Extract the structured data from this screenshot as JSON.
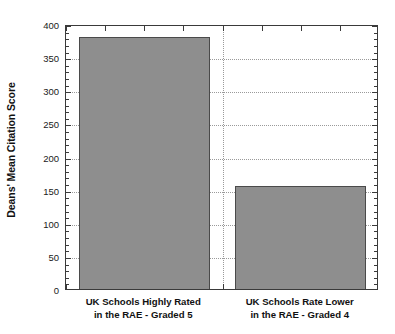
{
  "chart_data": {
    "type": "bar",
    "title": "",
    "subtitle": "",
    "xlabel": "",
    "ylabel": "Deans' Mean Citation Score",
    "categories": [
      "UK Schools Highly Rated\nin the RAE - Graded 5",
      "UK Schools Rate Lower\nin the RAE - Graded 4"
    ],
    "category_lines": [
      [
        "UK Schools Highly Rated",
        "in the RAE - Graded 5"
      ],
      [
        "UK Schools Rate Lower",
        "in the RAE - Graded 4"
      ]
    ],
    "values": [
      381,
      155
    ],
    "ylim": [
      0,
      400
    ],
    "ytick_values": [
      0,
      50,
      100,
      150,
      200,
      250,
      300,
      350,
      400
    ],
    "ytick_labels": [
      "0",
      "50",
      "100",
      "150",
      "200",
      "250",
      "300",
      "350",
      "400"
    ],
    "minor_tick_step": 10,
    "grid": {
      "horizontal": true,
      "vertical": true,
      "style": "dotted",
      "color": "#9a9a9a"
    },
    "legend": null,
    "colors": {
      "bar_fill": "#8e8e8e",
      "bar_edge": "#4a4a4a",
      "axis": "#3a3a3a",
      "grid": "#9a9a9a",
      "text": "#111111",
      "background": "#ffffff"
    }
  }
}
